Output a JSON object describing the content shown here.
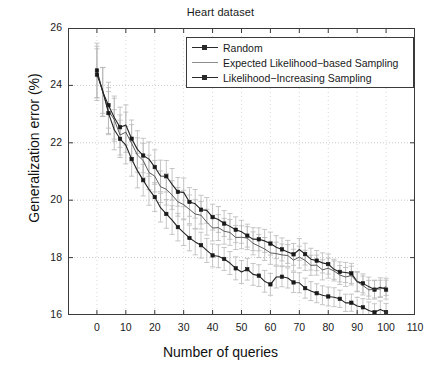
{
  "chart_data": {
    "type": "line",
    "title": "Heart dataset",
    "xlabel": "Number of queries",
    "ylabel": "Generalization error (%)",
    "xlim": [
      -10,
      110
    ],
    "ylim": [
      16,
      26
    ],
    "xticks": [
      0,
      10,
      20,
      30,
      40,
      50,
      60,
      70,
      80,
      90,
      100,
      110
    ],
    "yticks": [
      16,
      18,
      20,
      22,
      24,
      26
    ],
    "grid": true,
    "grid_style": "dotted",
    "legend_position": "top-right-inside",
    "errorbars": true,
    "errorbar_color": "#b9b9b9",
    "line_color": "#2a2a2a",
    "x": [
      0,
      2,
      4,
      6,
      8,
      10,
      12,
      14,
      16,
      18,
      20,
      22,
      24,
      26,
      28,
      30,
      32,
      34,
      36,
      38,
      40,
      42,
      44,
      46,
      48,
      50,
      52,
      54,
      56,
      58,
      60,
      62,
      64,
      66,
      68,
      70,
      72,
      74,
      76,
      78,
      80,
      82,
      84,
      86,
      88,
      90,
      92,
      94,
      96,
      98,
      100
    ],
    "series": [
      {
        "name": "Random",
        "marker": "square-dot",
        "values": [
          24.45,
          23.85,
          23.3,
          22.9,
          22.55,
          22.6,
          22.2,
          21.8,
          21.55,
          21.35,
          21.1,
          20.9,
          20.75,
          20.5,
          20.3,
          20.2,
          19.95,
          19.85,
          19.7,
          19.6,
          19.4,
          19.3,
          19.2,
          19.15,
          19.0,
          18.9,
          18.85,
          18.7,
          18.65,
          18.5,
          18.45,
          18.4,
          18.3,
          18.25,
          18.1,
          18.2,
          18.05,
          17.95,
          17.85,
          17.8,
          17.7,
          17.6,
          17.55,
          17.45,
          17.4,
          17.2,
          17.1,
          17.05,
          16.95,
          17.0,
          16.95
        ],
        "err": [
          0.95,
          0.85,
          0.8,
          0.75,
          0.7,
          0.7,
          0.65,
          0.65,
          0.6,
          0.6,
          0.6,
          0.55,
          0.55,
          0.55,
          0.5,
          0.5,
          0.5,
          0.5,
          0.5,
          0.45,
          0.45,
          0.45,
          0.45,
          0.45,
          0.45,
          0.4,
          0.4,
          0.4,
          0.4,
          0.4,
          0.4,
          0.4,
          0.4,
          0.4,
          0.38,
          0.38,
          0.38,
          0.38,
          0.35,
          0.35,
          0.35,
          0.35,
          0.35,
          0.35,
          0.35,
          0.35,
          0.33,
          0.33,
          0.33,
          0.33,
          0.33
        ]
      },
      {
        "name": "Expected Likelihood-based Sampling",
        "marker": "none",
        "values": [
          24.4,
          23.8,
          23.2,
          22.75,
          22.35,
          22.45,
          22.0,
          21.6,
          21.3,
          21.05,
          20.8,
          20.55,
          20.4,
          20.15,
          19.95,
          19.85,
          19.6,
          19.5,
          19.4,
          19.3,
          19.1,
          19.05,
          18.95,
          18.9,
          18.75,
          18.65,
          18.6,
          18.45,
          18.4,
          18.3,
          18.2,
          18.2,
          18.1,
          18.05,
          17.9,
          18.05,
          17.85,
          17.75,
          17.7,
          17.65,
          17.55,
          17.45,
          17.4,
          17.3,
          17.3,
          17.1,
          17.0,
          16.95,
          16.9,
          16.95,
          16.9
        ],
        "err": [
          0.9,
          0.85,
          0.8,
          0.75,
          0.7,
          0.7,
          0.65,
          0.6,
          0.6,
          0.6,
          0.55,
          0.55,
          0.55,
          0.5,
          0.5,
          0.5,
          0.5,
          0.5,
          0.48,
          0.45,
          0.45,
          0.45,
          0.45,
          0.45,
          0.42,
          0.4,
          0.4,
          0.4,
          0.4,
          0.4,
          0.4,
          0.4,
          0.38,
          0.38,
          0.38,
          0.38,
          0.35,
          0.35,
          0.35,
          0.35,
          0.35,
          0.35,
          0.33,
          0.33,
          0.33,
          0.33,
          0.33,
          0.33,
          0.3,
          0.3,
          0.3
        ]
      },
      {
        "name": "Likelihood-Increasing Sampling",
        "marker": "square-dot",
        "values": [
          24.4,
          23.75,
          23.05,
          22.5,
          22.1,
          22.0,
          21.5,
          21.1,
          20.7,
          20.35,
          20.05,
          19.8,
          19.6,
          19.35,
          19.1,
          18.95,
          18.7,
          18.6,
          18.4,
          18.3,
          18.1,
          18.05,
          17.9,
          17.85,
          17.7,
          17.55,
          17.55,
          17.35,
          17.3,
          17.2,
          17.15,
          17.35,
          17.3,
          17.25,
          17.1,
          17.2,
          17.0,
          16.9,
          16.8,
          16.7,
          16.65,
          16.55,
          16.6,
          16.5,
          16.45,
          16.3,
          16.25,
          16.2,
          16.15,
          16.25,
          16.1
        ],
        "err": [
          0.9,
          0.8,
          0.75,
          0.7,
          0.65,
          0.65,
          0.6,
          0.6,
          0.55,
          0.55,
          0.5,
          0.5,
          0.5,
          0.5,
          0.48,
          0.45,
          0.45,
          0.45,
          0.45,
          0.42,
          0.4,
          0.4,
          0.4,
          0.4,
          0.4,
          0.4,
          0.38,
          0.38,
          0.38,
          0.38,
          0.38,
          0.38,
          0.35,
          0.35,
          0.35,
          0.35,
          0.35,
          0.33,
          0.33,
          0.33,
          0.33,
          0.33,
          0.3,
          0.3,
          0.3,
          0.3,
          0.3,
          0.3,
          0.3,
          0.3,
          0.3
        ]
      }
    ]
  },
  "legend": {
    "items": [
      {
        "label": "Random"
      },
      {
        "label": "Expected Likelihood−based Sampling"
      },
      {
        "label": "Likelihood−Increasing Sampling"
      }
    ]
  }
}
